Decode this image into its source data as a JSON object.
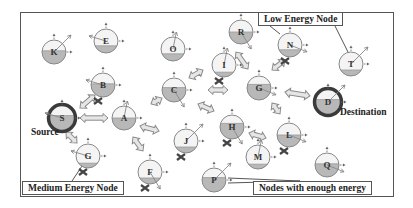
{
  "colors": {
    "node_fill_energy": "#b8b8b8",
    "node_empty": "#f4f4f4",
    "node_stroke": "#888888",
    "endpoint_ring": "#3a3a3a",
    "arrow_fill": "#e6e6e6",
    "arrow_stroke": "#8a8a8a",
    "cross": "#444444"
  },
  "labels": {
    "source": "Source",
    "destination": "Destination"
  },
  "callouts": {
    "low_energy": "Low Energy Node",
    "medium_energy": "Medium Energy Node",
    "enough_energy": "Nodes with enough energy"
  },
  "nodes": [
    {
      "id": "K",
      "x": 54,
      "y": 52,
      "level": 0.55,
      "failed": false,
      "role": "relay"
    },
    {
      "id": "E",
      "x": 106,
      "y": 41,
      "level": 0.3,
      "failed": false,
      "role": "relay"
    },
    {
      "id": "O",
      "x": 173,
      "y": 49,
      "level": 0.3,
      "failed": false,
      "role": "relay"
    },
    {
      "id": "R",
      "x": 241,
      "y": 32,
      "level": 0.5,
      "failed": false,
      "role": "relay"
    },
    {
      "id": "N",
      "x": 290,
      "y": 45,
      "level": 0.3,
      "failed": true,
      "role": "relay"
    },
    {
      "id": "T",
      "x": 351,
      "y": 64,
      "level": 0.25,
      "failed": false,
      "role": "relay"
    },
    {
      "id": "B",
      "x": 103,
      "y": 85,
      "level": 0.55,
      "failed": true,
      "role": "relay"
    },
    {
      "id": "I",
      "x": 224,
      "y": 65,
      "level": 0.2,
      "failed": true,
      "role": "relay"
    },
    {
      "id": "C",
      "x": 174,
      "y": 90,
      "level": 0.6,
      "failed": false,
      "role": "relay"
    },
    {
      "id": "G1",
      "label": "G",
      "x": 259,
      "y": 88,
      "level": 0.65,
      "failed": false,
      "role": "relay"
    },
    {
      "id": "D",
      "x": 328,
      "y": 102,
      "level": 0.6,
      "failed": false,
      "role": "destination"
    },
    {
      "id": "S",
      "x": 62,
      "y": 118,
      "level": 0.6,
      "failed": false,
      "role": "source"
    },
    {
      "id": "A",
      "x": 124,
      "y": 118,
      "level": 0.5,
      "failed": false,
      "role": "relay"
    },
    {
      "id": "H",
      "x": 232,
      "y": 127,
      "level": 0.65,
      "failed": true,
      "role": "relay"
    },
    {
      "id": "L",
      "x": 289,
      "y": 135,
      "level": 0.5,
      "failed": true,
      "role": "relay"
    },
    {
      "id": "J",
      "x": 186,
      "y": 141,
      "level": 0.25,
      "failed": true,
      "role": "relay"
    },
    {
      "id": "G2",
      "label": "G",
      "x": 88,
      "y": 156,
      "level": 0.2,
      "failed": true,
      "role": "relay"
    },
    {
      "id": "M",
      "x": 258,
      "y": 157,
      "level": 0.2,
      "failed": false,
      "role": "relay"
    },
    {
      "id": "F",
      "x": 150,
      "y": 172,
      "level": 0.25,
      "failed": true,
      "role": "relay"
    },
    {
      "id": "Q",
      "x": 327,
      "y": 165,
      "level": 0.55,
      "failed": false,
      "role": "relay"
    },
    {
      "id": "P",
      "x": 214,
      "y": 180,
      "level": 0.6,
      "failed": false,
      "role": "relay"
    }
  ],
  "links": [
    {
      "x1": 80,
      "y1": 108,
      "x2": 95,
      "y2": 95
    },
    {
      "x1": 80,
      "y1": 118,
      "x2": 108,
      "y2": 118
    },
    {
      "x1": 66,
      "y1": 132,
      "x2": 77,
      "y2": 143
    },
    {
      "x1": 151,
      "y1": 104,
      "x2": 162,
      "y2": 98
    },
    {
      "x1": 140,
      "y1": 126,
      "x2": 159,
      "y2": 131
    },
    {
      "x1": 133,
      "y1": 137,
      "x2": 143,
      "y2": 151
    },
    {
      "x1": 189,
      "y1": 78,
      "x2": 203,
      "y2": 70
    },
    {
      "x1": 208,
      "y1": 90,
      "x2": 228,
      "y2": 90
    },
    {
      "x1": 198,
      "y1": 104,
      "x2": 214,
      "y2": 111
    },
    {
      "x1": 248,
      "y1": 69,
      "x2": 236,
      "y2": 52
    },
    {
      "x1": 272,
      "y1": 70,
      "x2": 285,
      "y2": 60
    },
    {
      "x1": 285,
      "y1": 92,
      "x2": 310,
      "y2": 96
    },
    {
      "x1": 272,
      "y1": 103,
      "x2": 280,
      "y2": 114
    },
    {
      "x1": 249,
      "y1": 133,
      "x2": 266,
      "y2": 138
    }
  ]
}
